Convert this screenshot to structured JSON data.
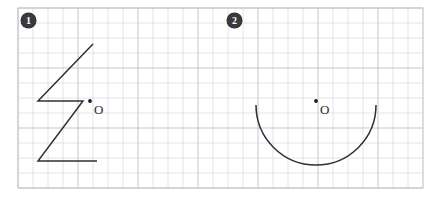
{
  "page": {
    "width": 433,
    "height": 207,
    "background_color": "#ffffff"
  },
  "grid": {
    "origin_x": 18,
    "origin_y": 8,
    "cell_size": 15,
    "cols": 27,
    "rows": 12,
    "minor_color": "#d9dde3",
    "major_color": "#b9bfc9",
    "border_color": "#c3c8d1"
  },
  "problems": [
    {
      "badge": "1",
      "badge_x": 21,
      "badge_y": 13,
      "figure_type": "polyline",
      "figure_name": "z-shaped-polyline",
      "points": "93,44 38,101 83,101 38,161 97,161",
      "center_point": {
        "label": "O",
        "dot_x": 90,
        "dot_y": 101,
        "label_x": 94,
        "label_y": 103
      },
      "stroke_color": "#2f3033"
    },
    {
      "badge": "2",
      "badge_x": 227,
      "badge_y": 13,
      "figure_type": "arc",
      "figure_name": "semicircle-arc",
      "path": "M 256,105 A 60,60 0 0 0 376,105",
      "center_point": {
        "label": "O",
        "dot_x": 316,
        "dot_y": 101,
        "label_x": 320,
        "label_y": 103
      },
      "stroke_color": "#2f3033"
    }
  ],
  "chart_data": {
    "type": "table",
    "title": "",
    "figures": [
      {
        "id": "1",
        "shape": "Z-shaped open polyline (5 vertices)",
        "vertices_grid": [
          [
            5,
            2.4
          ],
          [
            1.33,
            6.2
          ],
          [
            4.33,
            6.2
          ],
          [
            1.33,
            10.2
          ],
          [
            5.27,
            10.2
          ]
        ],
        "point_o_grid": [
          4.8,
          6.2
        ]
      },
      {
        "id": "2",
        "shape": "Lower semicircular arc (180 degrees)",
        "arc_center_grid": [
          19.87,
          6.47
        ],
        "arc_radius_grid": 4.0,
        "arc_start_grid": [
          15.87,
          6.47
        ],
        "arc_end_grid": [
          23.87,
          6.47
        ],
        "point_o_grid": [
          19.87,
          6.2
        ]
      }
    ]
  }
}
